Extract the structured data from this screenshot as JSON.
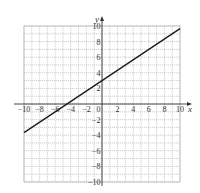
{
  "chart_data": {
    "type": "line",
    "title": "",
    "xlabel": "x",
    "ylabel": "y",
    "xlim": [
      -10,
      10
    ],
    "ylim": [
      -10,
      10
    ],
    "grid": true,
    "grid_step": 1,
    "x_ticks": [
      -10,
      -8,
      -6,
      -4,
      -2,
      0,
      2,
      4,
      6,
      8,
      10
    ],
    "x_tick_labels": [
      "−10",
      "−8",
      "−6",
      "−4",
      "−2",
      "0",
      "2",
      "4",
      "6",
      "8",
      "10"
    ],
    "y_ticks": [
      10,
      8,
      6,
      4,
      2,
      -2,
      -4,
      -6,
      -8,
      -10
    ],
    "y_tick_labels": [
      "10",
      "8",
      "6",
      "4",
      "2",
      "−2",
      "−4",
      "−6",
      "−8",
      "−10"
    ],
    "series": [
      {
        "name": "line",
        "equation": "y = (2/3)x + 3",
        "x": [
          -10,
          10
        ],
        "y": [
          -3.67,
          9.67
        ],
        "color": "#1a1a1a"
      }
    ],
    "legend": null
  },
  "colors": {
    "grid": "#b0b0b0",
    "axis": "#333333",
    "line": "#1a1a1a"
  }
}
